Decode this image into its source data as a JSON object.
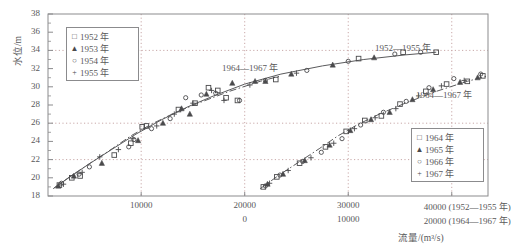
{
  "chart_data": {
    "type": "scatter",
    "title": "",
    "subtitle": "",
    "xlabel": "流量/(m³/s)",
    "ylabel": "水位/m",
    "grid": true,
    "legend_position": "inside-top-left, inside-right",
    "y_axis": {
      "label": "水位/m",
      "ticks": [
        18,
        20,
        22,
        24,
        26,
        28,
        30,
        32,
        34,
        36,
        38
      ],
      "tick_labels": [
        "18",
        "20",
        "22",
        "24",
        "26",
        "28",
        "30",
        "32",
        "34",
        "36",
        "38"
      ],
      "ylim": [
        18,
        38
      ]
    },
    "x_axis_primary": {
      "series_label": "(1952—1955 年)",
      "ticks": [
        10000,
        20000,
        30000,
        40000
      ],
      "tick_labels": [
        "10000",
        "20000",
        "30000",
        "40000"
      ],
      "xlim": [
        1000,
        43500
      ]
    },
    "x_axis_secondary": {
      "series_label": "(1964—1967 年)",
      "ticks": [
        0,
        10000,
        20000
      ],
      "tick_labels": [
        "0",
        "10000",
        "20000"
      ]
    },
    "gridlines": {
      "horizontal_y": [
        22,
        26,
        34
      ],
      "vertical_x_primary": [
        10000,
        20000,
        30000,
        40000
      ]
    },
    "annotations": [
      {
        "text": "1952—1955 年",
        "x": 32600,
        "y": 33.2
      },
      {
        "text": "1964—1967 年",
        "x": 19200,
        "y": 31.2
      },
      {
        "text": "1964—1967 年",
        "x": 40200,
        "y": 29.4
      }
    ],
    "legends": [
      {
        "name": "legend-1952-1955",
        "entries": [
          {
            "label": "1952 年",
            "marker": "square"
          },
          {
            "label": "1953 年",
            "marker": "triangle"
          },
          {
            "label": "1954 年",
            "marker": "circle"
          },
          {
            "label": "1955 年",
            "marker": "plus"
          }
        ]
      },
      {
        "name": "legend-1964-1967",
        "entries": [
          {
            "label": "1964 年",
            "marker": "square"
          },
          {
            "label": "1965 年",
            "marker": "triangle"
          },
          {
            "label": "1966 年",
            "marker": "circle"
          },
          {
            "label": "1967 年",
            "marker": "plus"
          }
        ]
      }
    ],
    "curves": [
      {
        "name": "1952—1955 年 rating curve",
        "style": "solid",
        "points": [
          [
            1600,
            18.9
          ],
          [
            3000,
            20.0
          ],
          [
            4800,
            21.4
          ],
          [
            7000,
            23.0
          ],
          [
            9500,
            24.8
          ],
          [
            12000,
            26.4
          ],
          [
            14500,
            27.8
          ],
          [
            17000,
            29.0
          ],
          [
            20000,
            30.3
          ],
          [
            23500,
            31.4
          ],
          [
            27500,
            32.3
          ],
          [
            31500,
            33.0
          ],
          [
            35500,
            33.5
          ],
          [
            38500,
            33.8
          ]
        ]
      },
      {
        "name": "1964—1967 年 rating curve",
        "style": "dash-dot",
        "points": [
          [
            1500,
            18.8
          ],
          [
            3200,
            20.2
          ],
          [
            5200,
            21.7
          ],
          [
            7200,
            23.2
          ],
          [
            9000,
            24.6
          ],
          [
            11000,
            25.9
          ],
          [
            13000,
            27.0
          ],
          [
            15500,
            28.2
          ],
          [
            18500,
            29.5
          ],
          [
            21500,
            30.6
          ],
          [
            23500,
            31.2
          ]
        ]
      }
    ],
    "series": [
      {
        "name": "1952 年",
        "marker": "square",
        "points": [
          [
            2100,
            19.2
          ],
          [
            3300,
            20.0
          ],
          [
            4100,
            20.2
          ],
          [
            7400,
            22.5
          ],
          [
            9000,
            23.8
          ],
          [
            10100,
            25.6
          ],
          [
            10500,
            25.7
          ],
          [
            13600,
            27.5
          ],
          [
            15200,
            28.2
          ],
          [
            16500,
            29.9
          ],
          [
            17400,
            29.6
          ],
          [
            18200,
            28.8
          ],
          [
            19300,
            28.5
          ],
          [
            23000,
            30.8
          ],
          [
            31000,
            33.1
          ],
          [
            35300,
            33.8
          ],
          [
            38500,
            33.8
          ]
        ]
      },
      {
        "name": "1953 年",
        "marker": "triangle",
        "points": [
          [
            2000,
            19.1
          ],
          [
            3500,
            20.2
          ],
          [
            6200,
            21.6
          ],
          [
            9700,
            24.1
          ],
          [
            12100,
            26.0
          ],
          [
            13900,
            27.6
          ],
          [
            14700,
            27.0
          ],
          [
            16300,
            29.2
          ],
          [
            18800,
            30.4
          ],
          [
            21000,
            30.6
          ],
          [
            22000,
            30.6
          ],
          [
            24500,
            31.4
          ],
          [
            28500,
            32.4
          ],
          [
            32500,
            33.2
          ]
        ]
      },
      {
        "name": "1954 年",
        "marker": "circle",
        "points": [
          [
            2300,
            19.4
          ],
          [
            4000,
            20.4
          ],
          [
            5000,
            21.2
          ],
          [
            8800,
            23.4
          ],
          [
            9300,
            24.2
          ],
          [
            11000,
            25.4
          ],
          [
            12800,
            26.5
          ],
          [
            14300,
            28.8
          ],
          [
            15800,
            29.1
          ],
          [
            17200,
            29.3
          ],
          [
            19500,
            28.5
          ],
          [
            22000,
            30.7
          ],
          [
            26000,
            31.8
          ],
          [
            30000,
            32.8
          ],
          [
            34500,
            33.6
          ],
          [
            37000,
            33.8
          ]
        ]
      },
      {
        "name": "1955 年",
        "marker": "plus",
        "points": [
          [
            2500,
            19.3
          ],
          [
            4300,
            20.6
          ],
          [
            6000,
            22.3
          ],
          [
            7800,
            23.1
          ],
          [
            9200,
            24.3
          ],
          [
            11500,
            25.7
          ],
          [
            13200,
            27.0
          ],
          [
            15000,
            28.2
          ],
          [
            16800,
            29.6
          ],
          [
            18000,
            28.5
          ],
          [
            20500,
            30.2
          ],
          [
            25000,
            31.5
          ]
        ]
      },
      {
        "name": "1964 年",
        "marker": "square",
        "points": [
          [
            1800,
            19.0
          ],
          [
            3100,
            20.1
          ],
          [
            5300,
            21.6
          ],
          [
            7800,
            23.4
          ],
          [
            9800,
            25.1
          ],
          [
            11600,
            26.3
          ],
          [
            13200,
            26.8
          ],
          [
            15000,
            28.1
          ],
          [
            17500,
            29.5
          ],
          [
            19500,
            30.3
          ],
          [
            21500,
            30.6
          ],
          [
            23000,
            31.2
          ]
        ]
      },
      {
        "name": "1965 年",
        "marker": "triangle",
        "points": [
          [
            2200,
            19.3
          ],
          [
            3700,
            20.4
          ],
          [
            5800,
            21.9
          ],
          [
            8200,
            23.6
          ],
          [
            10200,
            25.2
          ],
          [
            12200,
            26.4
          ],
          [
            14000,
            27.2
          ],
          [
            16200,
            28.6
          ],
          [
            18200,
            29.7
          ],
          [
            20800,
            30.5
          ],
          [
            22500,
            31.0
          ]
        ]
      },
      {
        "name": "1966 年",
        "marker": "circle",
        "points": [
          [
            2000,
            19.1
          ],
          [
            3400,
            20.3
          ],
          [
            5600,
            21.8
          ],
          [
            7400,
            22.8
          ],
          [
            9400,
            24.3
          ],
          [
            11200,
            25.8
          ],
          [
            13400,
            27.2
          ],
          [
            15600,
            28.4
          ],
          [
            17800,
            29.9
          ],
          [
            20200,
            30.9
          ],
          [
            22800,
            31.4
          ]
        ]
      },
      {
        "name": "1967 年",
        "marker": "plus",
        "points": [
          [
            2400,
            19.4
          ],
          [
            4200,
            20.8
          ],
          [
            6400,
            22.2
          ],
          [
            8600,
            23.8
          ],
          [
            10600,
            25.4
          ],
          [
            12600,
            26.6
          ],
          [
            14600,
            27.6
          ],
          [
            16800,
            29.0
          ],
          [
            19000,
            30.1
          ],
          [
            21200,
            30.7
          ]
        ]
      }
    ]
  },
  "axis": {
    "y_title": "水位/m",
    "x_title": "流量/(m³/s)",
    "y_ticks": [
      "38",
      "36",
      "34",
      "32",
      "30",
      "28",
      "26",
      "24",
      "22",
      "20",
      "18"
    ],
    "x_ticks_row1": [
      "10000",
      "20000",
      "30000",
      "40000 (1952—1955 年)"
    ],
    "x_ticks_row2": [
      "0",
      "10000",
      "20000 (1964—1967 年)"
    ]
  },
  "legend_a": {
    "entries": [
      {
        "marker": "□",
        "label": "1952 年"
      },
      {
        "marker": "▲",
        "label": "1953 年"
      },
      {
        "marker": "○",
        "label": "1954 年"
      },
      {
        "marker": "+",
        "label": "1955 年"
      }
    ]
  },
  "legend_b": {
    "entries": [
      {
        "marker": "□",
        "label": "1964 年"
      },
      {
        "marker": "▲",
        "label": "1965 年"
      },
      {
        "marker": "○",
        "label": "1966 年"
      },
      {
        "marker": "+",
        "label": "1967 年"
      }
    ]
  },
  "annotations": {
    "a": "1952—1955 年",
    "b": "1964—1967 年",
    "c": "1964—1967 年"
  },
  "colors": {
    "ink": "#58585a",
    "frame": "#8b8b8d",
    "grid": "#c9a9a9",
    "marker": "#4a4a4c"
  }
}
